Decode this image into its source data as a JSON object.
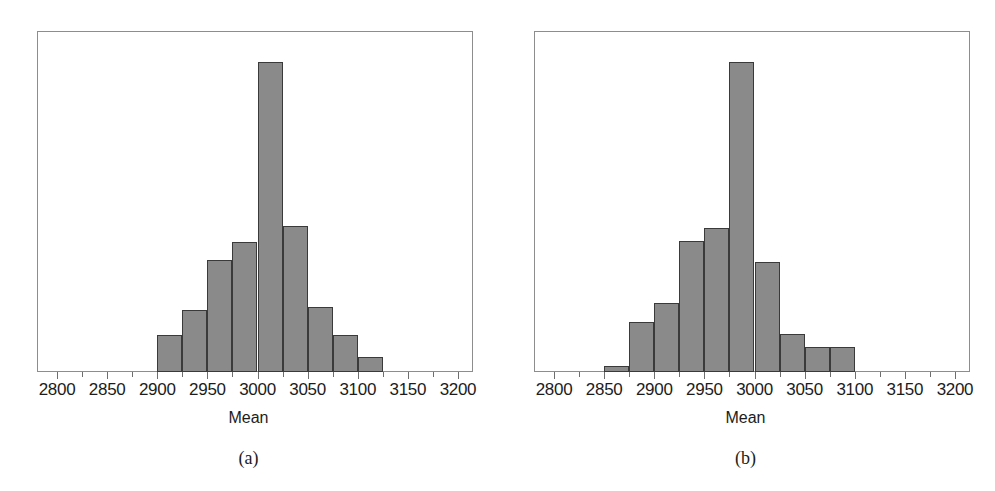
{
  "figure": {
    "background": "#ffffff",
    "bar_fill": "#8a8a8a",
    "bar_stroke": "#3a3a3a",
    "frame_color": "#8d8d8d"
  },
  "panels": [
    {
      "id": "a",
      "caption": "(a)",
      "axis_title": "Mean",
      "tick_labels": [
        "2800",
        "2850",
        "2900",
        "2950",
        "3000",
        "3050",
        "3100",
        "3150",
        "3200"
      ]
    },
    {
      "id": "b",
      "caption": "(b)",
      "axis_title": "Mean",
      "tick_labels": [
        "2800",
        "2850",
        "2900",
        "2950",
        "3000",
        "3050",
        "3100",
        "3150",
        "3200"
      ]
    }
  ],
  "chart_data": [
    {
      "type": "bar",
      "subplot": "(a)",
      "title": "",
      "xlabel": "Mean",
      "ylabel": "",
      "xlim": [
        2780,
        3215
      ],
      "ylim": [
        0,
        100
      ],
      "grid": false,
      "legend": "none",
      "xticks": [
        2800,
        2850,
        2900,
        2950,
        3000,
        3050,
        3100,
        3150,
        3200
      ],
      "bin_width": 25,
      "bin_edges": [
        2900,
        2925,
        2950,
        2975,
        3000,
        3025,
        3050,
        3075,
        3100,
        3125
      ],
      "categories": [
        "2900-2925",
        "2925-2950",
        "2950-2975",
        "2975-3000",
        "3000-3025",
        "3025-3050",
        "3050-3075",
        "3075-3100",
        "3100-3125"
      ],
      "values": [
        12,
        20,
        36,
        42,
        100,
        47,
        21,
        12,
        5
      ]
    },
    {
      "type": "bar",
      "subplot": "(b)",
      "title": "",
      "xlabel": "Mean",
      "ylabel": "",
      "xlim": [
        2780,
        3215
      ],
      "ylim": [
        0,
        100
      ],
      "grid": false,
      "legend": "none",
      "xticks": [
        2800,
        2850,
        2900,
        2950,
        3000,
        3050,
        3100,
        3150,
        3200
      ],
      "bin_width": 25,
      "bin_edges": [
        2850,
        2875,
        2900,
        2925,
        2950,
        2975,
        3000,
        3025,
        3050,
        3075,
        3100,
        3125
      ],
      "categories": [
        "2850-2900",
        "2900-2925",
        "2925-2950",
        "2950-2975",
        "2975-3000",
        "3000-3025",
        "3025-3050",
        "3050-3075",
        "3075-3100",
        "3100-3125"
      ],
      "values": [
        2,
        16,
        22,
        42,
        46,
        99,
        35,
        12,
        8,
        8
      ]
    }
  ]
}
